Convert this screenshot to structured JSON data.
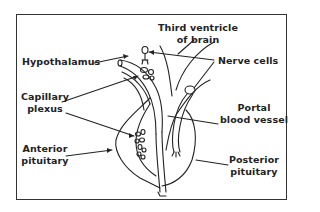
{
  "figure": {
    "type": "anatomical-diagram",
    "colors": {
      "line": "#222222",
      "frame": "#333333",
      "background": "#ffffff"
    }
  },
  "labels": {
    "third_ventricle": {
      "line1": "Third ventricle",
      "line2": "of brain"
    },
    "hypothalamus": {
      "line1": "Hypothalamus"
    },
    "nerve_cells": {
      "line1": "Nerve cells"
    },
    "capillary_plexus": {
      "line1": "Capillary",
      "line2": "plexus"
    },
    "portal_blood_vessel": {
      "line1": "Portal",
      "line2": "blood vessel"
    },
    "anterior_pituitary": {
      "line1": "Anterior",
      "line2": "pituitary"
    },
    "posterior_pituitary": {
      "line1": "Posterior",
      "line2": "pituitary"
    }
  }
}
